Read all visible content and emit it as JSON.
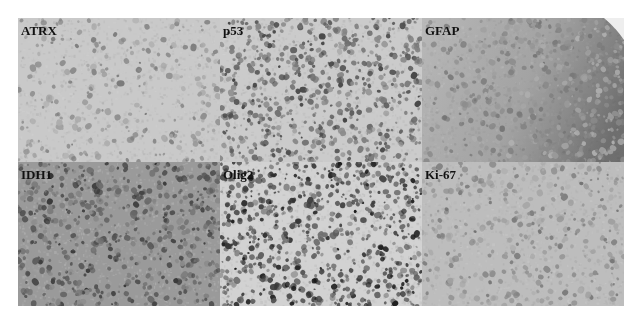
{
  "figure": {
    "layout": {
      "rows": 2,
      "cols": 3
    },
    "panels": [
      {
        "label": "ATRX",
        "background": "#c9c9c9",
        "density": 0.55,
        "darkness": 0.55,
        "gradient": null
      },
      {
        "label": "p53",
        "background": "#cbcbcb",
        "density": 1.35,
        "darkness": 0.75,
        "gradient": null
      },
      {
        "label": "GFAP",
        "background": "#b9b9b9",
        "density": 1.8,
        "darkness": 0.55,
        "gradient": "right-dark"
      },
      {
        "label": "IDH1",
        "background": "#9a9a9a",
        "density": 1.3,
        "darkness": 0.8,
        "gradient": null
      },
      {
        "label": "Olig2",
        "background": "#d2d2d2",
        "density": 1.5,
        "darkness": 0.92,
        "gradient": null
      },
      {
        "label": "Ki-67",
        "background": "#bdbdbd",
        "density": 0.8,
        "darkness": 0.55,
        "gradient": null
      }
    ]
  }
}
